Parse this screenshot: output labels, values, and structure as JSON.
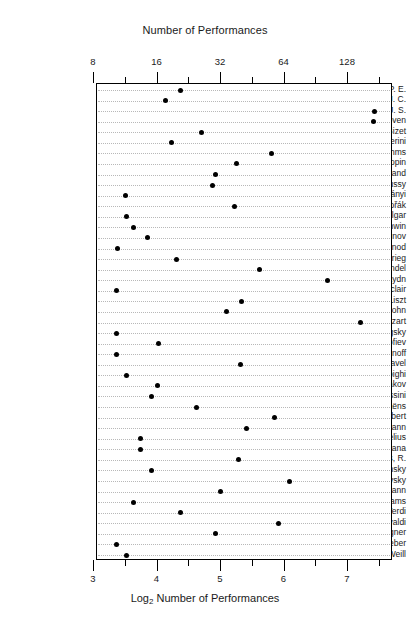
{
  "chart_data": {
    "type": "scatter",
    "subtype": "cleveland-dot-plot",
    "title": "Number of Performances",
    "xlabel": "Log2 Number of Performances",
    "xlabel_base": "Log",
    "xlabel_sub": "2",
    "xlabel_rest": " Number of Performances",
    "ylabel": "",
    "grid": true,
    "legend": "none",
    "orientation": "horizontal",
    "x_axis_top": {
      "label": "Number of Performances",
      "scale": "log2",
      "major_ticks": [
        8,
        16,
        32,
        64,
        128
      ],
      "major_tick_labels": [
        "8",
        "16",
        "32",
        "64",
        "128"
      ],
      "minor_ticks_log2": [
        3.5,
        4.5,
        5.5,
        6.5,
        7.5
      ]
    },
    "x_axis_bottom": {
      "label": "Log2 Number of Performances",
      "scale": "linear",
      "major_ticks": [
        3,
        4,
        5,
        6,
        7
      ],
      "major_tick_labels": [
        "3",
        "4",
        "5",
        "6",
        "7"
      ],
      "minor_ticks": [
        3.5,
        4.5,
        5.5,
        6.5,
        7.5
      ]
    },
    "xlim_log2": [
      3.0,
      7.65
    ],
    "categories": [
      "Bach, C. P. E.",
      "Bach, J. C.",
      "Bach, J. S.",
      "Beethoven",
      "Bizet",
      "Boccherini",
      "Brahms",
      "Chopin",
      "Copland",
      "Debussy",
      "Dohnányi",
      "Dvořák",
      "Elgar",
      "Gershwin",
      "Glazounov",
      "Gounod",
      "Grieg",
      "Handel",
      "Haydn",
      "Leclair",
      "Liszt",
      "Mendelssohn",
      "Mozart",
      "Mussorgsky",
      "Prokofiev",
      "Rachmaninoff",
      "Ravel",
      "Respighi",
      "Rimsky-Korsakov",
      "Rossini",
      "Saint-Saëns",
      "Schubert",
      "Schumann",
      "Sibelius",
      "Smetana",
      "Strauss, R.",
      "Stravinsky",
      "Tchaikovsky",
      "Telemann",
      "Vaughan-Williams",
      "Verdi",
      "Vivaldi",
      "Wagner",
      "Weber",
      "Weill"
    ],
    "values_log2": [
      4.37,
      4.13,
      7.41,
      7.4,
      4.7,
      4.22,
      5.8,
      5.25,
      4.92,
      4.86,
      3.5,
      5.22,
      3.51,
      3.62,
      3.85,
      3.37,
      4.3,
      5.6,
      6.67,
      3.36,
      5.33,
      5.08,
      7.19,
      3.36,
      4.01,
      3.35,
      5.31,
      3.51,
      4.0,
      3.91,
      4.61,
      5.85,
      5.4,
      3.74,
      3.74,
      5.27,
      3.91,
      6.08,
      4.99,
      3.62,
      4.36,
      5.91,
      4.92,
      3.36,
      3.51
    ],
    "values_performances": [
      21,
      17,
      170,
      169,
      26,
      19,
      56,
      38,
      30,
      29,
      11,
      37,
      11,
      12,
      14,
      10,
      20,
      49,
      102,
      10,
      40,
      34,
      146,
      10,
      16,
      10,
      40,
      11,
      16,
      15,
      24,
      58,
      42,
      13,
      13,
      39,
      15,
      68,
      32,
      12,
      21,
      60,
      30,
      10,
      11
    ]
  }
}
